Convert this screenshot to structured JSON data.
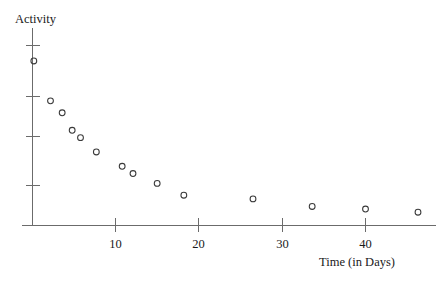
{
  "chart_data": {
    "type": "scatter",
    "title": "Activity",
    "xlabel": "Time (in Days)",
    "ylabel": "Activity",
    "x": [
      0.2,
      2.2,
      3.6,
      4.8,
      5.8,
      7.7,
      10.8,
      12.1,
      15.0,
      18.2,
      26.5,
      33.6,
      40.0,
      46.3,
      11.4
    ],
    "y": [
      9.78,
      7.41,
      6.7,
      5.66,
      5.22,
      4.37,
      3.52,
      3.09,
      2.5,
      1.8,
      1.58,
      1.13,
      0.98,
      0.79,
      3.3
    ],
    "points": [
      {
        "x": 0.2,
        "y": 9.78
      },
      {
        "x": 2.2,
        "y": 7.41
      },
      {
        "x": 3.6,
        "y": 6.7
      },
      {
        "x": 4.8,
        "y": 5.66
      },
      {
        "x": 5.8,
        "y": 5.22
      },
      {
        "x": 7.7,
        "y": 4.37
      },
      {
        "x": 10.8,
        "y": 3.52
      },
      {
        "x": 12.1,
        "y": 3.09
      },
      {
        "x": 15.0,
        "y": 2.5
      },
      {
        "x": 18.2,
        "y": 1.8
      },
      {
        "x": 26.5,
        "y": 1.58
      },
      {
        "x": 33.6,
        "y": 1.13
      },
      {
        "x": 40.0,
        "y": 0.98
      },
      {
        "x": 46.3,
        "y": 0.79
      }
    ],
    "xlim": [
      -0.6,
      49.5
    ],
    "ylim": [
      0,
      11.6
    ],
    "xticks": [
      10,
      20,
      30,
      40
    ],
    "xtick_labels": [
      "10",
      "20",
      "30",
      "40"
    ],
    "yticks": [
      4.2,
      6.45,
      8.45,
      10.7
    ],
    "ytick_labels": [
      "",
      "",
      "",
      ""
    ],
    "grid": false,
    "legend": false,
    "marker": "open-circle",
    "marker_color": "#3a3a3a",
    "axis_color": "#6b6b6b",
    "background": "#ffffff"
  },
  "labels": {
    "title": "Activity",
    "x_axis_title": "Time (in Days)"
  }
}
